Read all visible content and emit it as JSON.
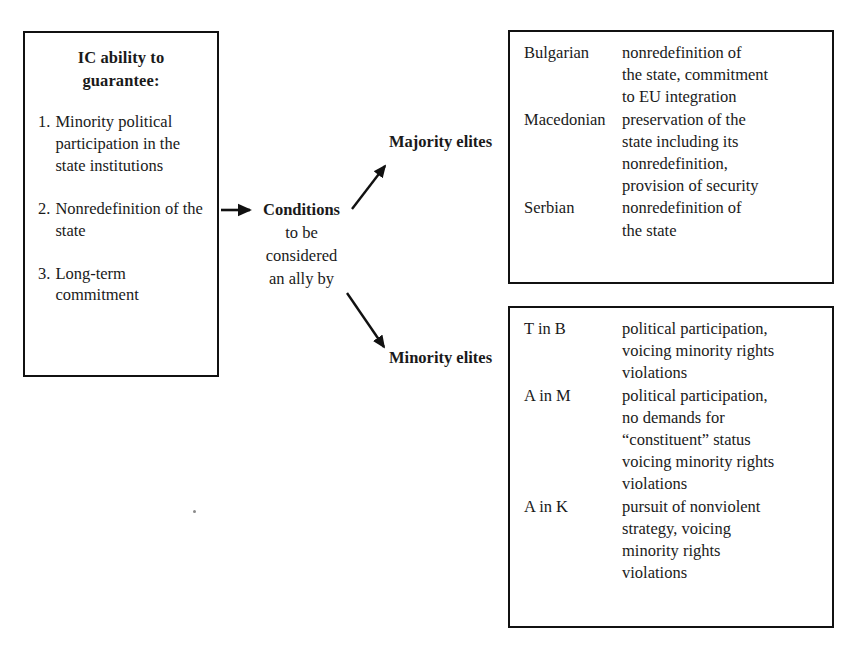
{
  "diagram": {
    "ic_box": {
      "title_line1": "IC ability to",
      "title_line2": "guarantee:",
      "conditions": [
        {
          "num": "1.",
          "text": "Minority political participation in the state institutions"
        },
        {
          "num": "2.",
          "text": "Nonredefinition of the state"
        },
        {
          "num": "3.",
          "text": "Long-term commitment"
        }
      ]
    },
    "center": {
      "heading": "Conditions",
      "line1": "to be",
      "line2": "considered",
      "line3": "an ally by"
    },
    "branches": {
      "majority_label": "Majority elites",
      "minority_label": "Minority elites"
    },
    "majority_table": {
      "rows": [
        {
          "group": "Bulgarian",
          "lines": [
            "nonredefinition of",
            "the state, commitment",
            "to EU integration"
          ]
        },
        {
          "group": "Macedonian",
          "lines": [
            "preservation of the",
            "state including its",
            "nonredefinition,",
            "provision of security"
          ]
        },
        {
          "group": "Serbian",
          "lines": [
            "nonredefinition of",
            "the state"
          ]
        }
      ]
    },
    "minority_table": {
      "rows": [
        {
          "group": "T in B",
          "lines": [
            "political participation,",
            "voicing minority rights",
            "violations"
          ]
        },
        {
          "group": "A in M",
          "lines": [
            "political participation,",
            "no demands for",
            "“constituent” status",
            "voicing minority rights",
            "violations"
          ]
        },
        {
          "group": "A in K",
          "lines": [
            "pursuit of nonviolent",
            "strategy, voicing",
            "minority rights",
            "violations"
          ]
        }
      ]
    },
    "colors": {
      "stroke": "#111111",
      "text": "#1a1a1a",
      "background": "#ffffff"
    }
  }
}
